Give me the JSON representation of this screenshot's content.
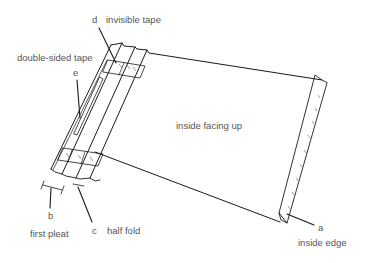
{
  "diagram": {
    "labels": {
      "d_letter": "d",
      "d_text": "invisible tape",
      "double_sided": "double-sided tape",
      "e_letter": "e",
      "inside_facing": "inside facing up",
      "b_letter": "b",
      "b_text": "first pleat",
      "c_letter": "c",
      "c_text": "half fold",
      "a_letter": "a",
      "a_text": "inside edge"
    },
    "colors": {
      "line": "#1a1a1a",
      "text": "#555555",
      "background": "#ffffff"
    }
  }
}
